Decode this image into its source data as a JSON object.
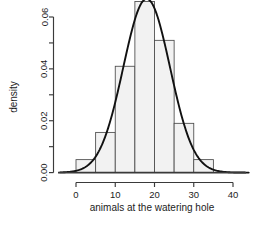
{
  "chart_data": {
    "type": "bar",
    "title": "",
    "subtitle": "",
    "xlabel": "animals at the watering hole",
    "ylabel": "density",
    "xlim": [
      -4,
      44
    ],
    "ylim": [
      0,
      0.068
    ],
    "grid": false,
    "legend": null,
    "x_ticks": [
      0,
      10,
      20,
      30,
      40
    ],
    "x_tick_labels": [
      "0",
      "10",
      "20",
      "30",
      "40"
    ],
    "y_ticks": [
      0.0,
      0.01,
      0.02,
      0.03,
      0.04,
      0.05,
      0.06
    ],
    "y_tick_labels": [
      "0.00",
      "",
      "0.02",
      "",
      "0.04",
      "",
      "0.06"
    ],
    "bin_width": 5,
    "bin_edges": [
      0,
      5,
      10,
      15,
      20,
      25,
      30,
      35
    ],
    "categories": [
      "0-5",
      "5-10",
      "10-15",
      "15-20",
      "20-25",
      "25-30",
      "30-35"
    ],
    "values": [
      0.005,
      0.0155,
      0.041,
      0.066,
      0.051,
      0.019,
      0.005
    ],
    "series": [
      {
        "name": "histogram",
        "type": "bar",
        "values": [
          0.005,
          0.0155,
          0.041,
          0.066,
          0.051,
          0.019,
          0.005
        ]
      },
      {
        "name": "density",
        "type": "line",
        "mean": 18.0,
        "sd": 5.95,
        "peak_x": 18.0,
        "peak_y": 0.067,
        "x": [
          -4,
          -2,
          0,
          2,
          4,
          6,
          8,
          10,
          12,
          14,
          16,
          18,
          20,
          22,
          24,
          26,
          28,
          30,
          32,
          34,
          36,
          38,
          40,
          42,
          44
        ],
        "y": [
          0.0,
          0.0001,
          0.0004,
          0.0011,
          0.0027,
          0.0059,
          0.0112,
          0.019,
          0.0292,
          0.0408,
          0.0522,
          0.0613,
          0.0663,
          0.066,
          0.0606,
          0.0513,
          0.04,
          0.0287,
          0.0189,
          0.0114,
          0.0063,
          0.0032,
          0.0015,
          0.0006,
          0.0002
        ]
      }
    ]
  },
  "axes": {
    "x_axis_label": "animals at the watering hole",
    "y_axis_label": "density"
  },
  "colors": {
    "bar_fill": "#f2f2f2",
    "bar_stroke": "#4a4a4a",
    "curve": "#111111",
    "axis": "#3a3a3a",
    "text": "#1c1c1c",
    "background": "#ffffff"
  }
}
